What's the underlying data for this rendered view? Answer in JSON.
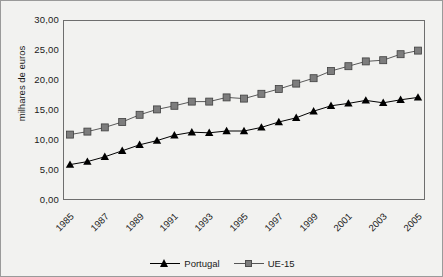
{
  "chart_data": {
    "type": "line",
    "title": "",
    "xlabel": "",
    "ylabel": "milhares de euros",
    "ylim": [
      0,
      30
    ],
    "yticks": [
      "0,00",
      "5,00",
      "10,00",
      "15,00",
      "20,00",
      "25,00",
      "30,00"
    ],
    "ytick_values": [
      0,
      5,
      10,
      15,
      20,
      25,
      30
    ],
    "grid": false,
    "legend_position": "bottom",
    "x": [
      1985,
      1986,
      1987,
      1988,
      1989,
      1990,
      1991,
      1992,
      1993,
      1994,
      1995,
      1996,
      1997,
      1998,
      1999,
      2000,
      2001,
      2002,
      2003,
      2004,
      2005
    ],
    "xtick_labels": [
      "1985",
      "1987",
      "1989",
      "1991",
      "1993",
      "1995",
      "1997",
      "1999",
      "2001",
      "2003",
      "2005"
    ],
    "xtick_values": [
      1985,
      1987,
      1989,
      1991,
      1993,
      1995,
      1997,
      1999,
      2001,
      2003,
      2005
    ],
    "series": [
      {
        "name": "Portugal",
        "marker": "triangle",
        "color": "#000000",
        "values": [
          5.9,
          6.4,
          7.2,
          8.2,
          9.2,
          9.9,
          10.8,
          11.3,
          11.2,
          11.5,
          11.5,
          12.1,
          13.0,
          13.7,
          14.8,
          15.7,
          16.1,
          16.6,
          16.2,
          16.7,
          17.1
        ]
      },
      {
        "name": "UE-15",
        "marker": "square",
        "color": "#7d7d7d",
        "values": [
          10.9,
          11.4,
          12.1,
          13.0,
          14.2,
          15.1,
          15.7,
          16.4,
          16.4,
          17.1,
          16.9,
          17.7,
          18.5,
          19.4,
          20.3,
          21.5,
          22.3,
          23.1,
          23.3,
          24.3,
          24.9
        ]
      }
    ]
  },
  "legend": {
    "entries": [
      {
        "label": "Portugal"
      },
      {
        "label": "UE-15"
      }
    ]
  }
}
